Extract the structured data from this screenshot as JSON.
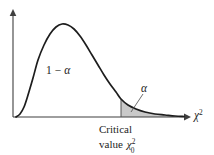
{
  "figure": {
    "name": "chi-square-distribution-critical-value",
    "background_color": "#ffffff",
    "curve_color": "#1d1d1d",
    "axis_color": "#3f3f3f",
    "shade_color": "#c9c9c9",
    "shade_edge_color": "#9a9a9a",
    "leader_color": "#555555"
  },
  "labels": {
    "body_area": {
      "text": "1 − α",
      "one": "1",
      "minus": "−",
      "alpha": "α"
    },
    "tail_area": {
      "text": "α",
      "alpha": "α"
    },
    "axis_label": {
      "text": "χ²",
      "base": "χ",
      "superscript": "2"
    },
    "caption": {
      "line1": "Critical",
      "line2_prefix": "value",
      "line2_symbol": "χ",
      "line2_superscript": "2",
      "line2_subscript": "0",
      "full": "Critical value χ²₀"
    }
  },
  "chart_data": {
    "type": "area",
    "title": "",
    "subtitle": "",
    "xlabel": "χ²",
    "ylabel": "",
    "grid": false,
    "legend_position": "none",
    "distribution": "chi-square",
    "xlim": [
      0,
      185
    ],
    "ylim": [
      0,
      1
    ],
    "axes": {
      "y_axis_x": 13,
      "y_axis_top": 12,
      "baseline_y": 117,
      "x_axis_start": 13,
      "x_axis_end": 188,
      "arrowheads": [
        "up",
        "right"
      ]
    },
    "curve_points": [
      [
        16,
        117
      ],
      [
        20,
        114
      ],
      [
        24,
        107
      ],
      [
        28,
        95
      ],
      [
        33,
        78
      ],
      [
        38,
        60
      ],
      [
        44,
        45
      ],
      [
        50,
        34
      ],
      [
        56,
        27
      ],
      [
        62,
        24
      ],
      [
        68,
        25
      ],
      [
        74,
        29
      ],
      [
        80,
        36
      ],
      [
        86,
        45
      ],
      [
        92,
        55
      ],
      [
        98,
        65
      ],
      [
        104,
        75
      ],
      [
        110,
        84
      ],
      [
        116,
        92
      ],
      [
        121,
        99
      ],
      [
        128,
        105
      ],
      [
        136,
        109
      ],
      [
        145,
        112
      ],
      [
        155,
        114
      ],
      [
        165,
        115
      ],
      [
        175,
        116
      ],
      [
        184,
        116.5
      ]
    ],
    "peak": {
      "x": 62,
      "y": 24
    },
    "critical_value": {
      "x": 121,
      "curve_y": 99,
      "baseline_y": 117,
      "label": "χ²₀"
    },
    "shaded_region": {
      "name": "rejection-region",
      "from_x": 121,
      "to_x": 184,
      "area_label": "α",
      "color": "#c9c9c9"
    },
    "unshaded_region": {
      "name": "acceptance-region",
      "area_label": "1 − α"
    },
    "annotations": [
      {
        "text": "1 − α",
        "x": 57,
        "y": 70
      },
      {
        "text": "α",
        "x": 146,
        "y": 89
      },
      {
        "text": "Critical value χ²₀",
        "x": 128,
        "y": 133
      }
    ],
    "leader_line": {
      "from": [
        143,
        94
      ],
      "to": [
        131,
        112
      ]
    }
  }
}
